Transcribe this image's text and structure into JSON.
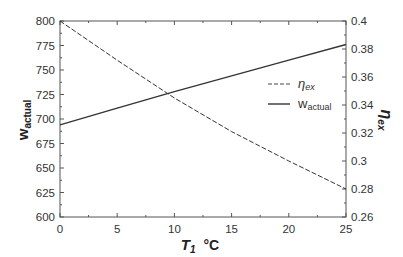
{
  "chart_data": {
    "type": "line",
    "title": "",
    "xlabel": "T1 °C",
    "xlabel_main": "T",
    "xlabel_sub": "1",
    "xlabel_unit": "°C",
    "ylabel_left": "wactual",
    "ylabel_left_main": "w",
    "ylabel_left_sub": "actual",
    "ylabel_right": "ηex",
    "ylabel_right_main": "η",
    "ylabel_right_sub": "ex",
    "xlim": [
      0,
      25
    ],
    "ylim_left": [
      600,
      800
    ],
    "ylim_right": [
      0.26,
      0.4
    ],
    "x_ticks": [
      "0",
      "5",
      "10",
      "15",
      "20",
      "25"
    ],
    "y_left_ticks": [
      "600",
      "625",
      "650",
      "675",
      "700",
      "725",
      "750",
      "775",
      "800"
    ],
    "y_right_ticks": [
      "0.26",
      "0.28",
      "0.3",
      "0.32",
      "0.34",
      "0.36",
      "0.38",
      "0.4"
    ],
    "grid": false,
    "legend_position": "center-right",
    "x": [
      0,
      5,
      10,
      15,
      20,
      25
    ],
    "series": [
      {
        "name": "ηex",
        "legend_main": "η",
        "legend_sub": "ex",
        "axis": "right",
        "style": "dashed",
        "values": [
          0.4,
          0.372,
          0.345,
          0.321,
          0.3,
          0.28
        ]
      },
      {
        "name": "wactual",
        "legend_main": "w",
        "legend_sub": "actual",
        "axis": "left",
        "style": "solid",
        "values": [
          694,
          711,
          728,
          744,
          760,
          776
        ]
      }
    ]
  },
  "colors": {
    "line": "#333333",
    "axis": "#555555",
    "background": "#ffffff"
  }
}
